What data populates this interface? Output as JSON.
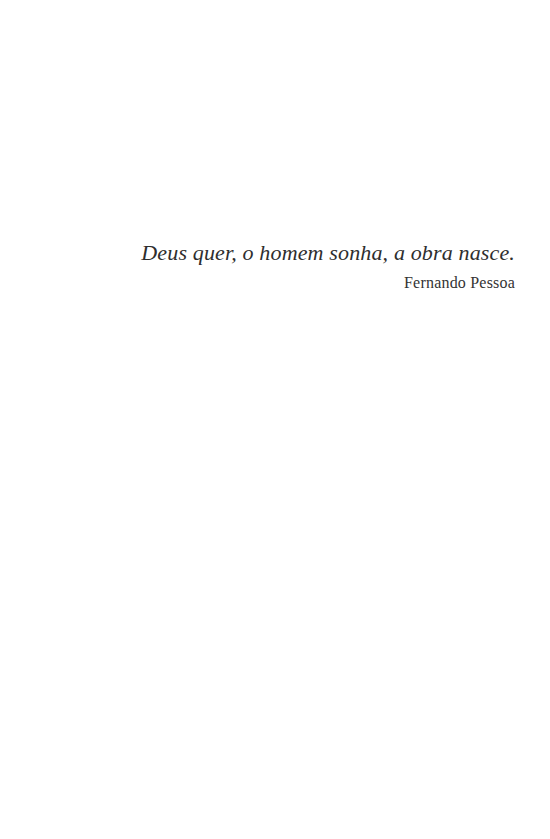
{
  "page": {
    "background_color": "#ffffff",
    "width": 550,
    "height": 839
  },
  "epigraph": {
    "quote": "Deus quer, o homem sonha, a obra nasce.",
    "attribution": "Fernando Pessoa",
    "quote_color": "#2e2e2e",
    "attribution_color": "#333333",
    "alignment": "right"
  }
}
